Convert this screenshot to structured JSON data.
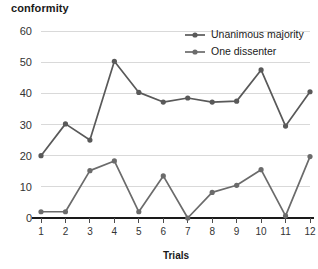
{
  "chart_data": {
    "type": "line",
    "title": "conformity",
    "xlabel": "Trials",
    "ylabel": "",
    "x": [
      1,
      2,
      3,
      4,
      5,
      6,
      7,
      8,
      9,
      10,
      11,
      12
    ],
    "xtick_labels": [
      "1",
      "2",
      "3",
      "4",
      "5",
      "6",
      "7",
      "8",
      "9",
      "10",
      "11",
      "12"
    ],
    "ytick_labels": [
      "0",
      "10",
      "20",
      "30",
      "40",
      "50",
      "60"
    ],
    "yticks": [
      0,
      10,
      20,
      30,
      40,
      50,
      60
    ],
    "ylim": [
      0,
      60
    ],
    "xlim": [
      1,
      12
    ],
    "grid": "horizontal",
    "legend_position": "top-right",
    "series": [
      {
        "name": "Unanimous majority",
        "color": "#595959",
        "marker": "circle",
        "values": [
          20.0,
          30.2,
          25.0,
          50.3,
          40.3,
          37.2,
          38.5,
          37.2,
          37.5,
          47.5,
          29.5,
          40.5
        ]
      },
      {
        "name": "One dissenter",
        "color": "#6b6b6b",
        "marker": "circle",
        "values": [
          2.0,
          2.0,
          15.2,
          18.3,
          2.0,
          13.5,
          0.0,
          8.2,
          10.5,
          15.5,
          0.7,
          19.7
        ]
      }
    ]
  },
  "legend": {
    "entries": [
      {
        "label": "Unanimous majority"
      },
      {
        "label": "One dissenter"
      }
    ]
  },
  "axes": {
    "x_title": "Trials",
    "y_title": ""
  },
  "colors": {
    "background": "#ffffff",
    "gridline": "#d9d9d9",
    "axis": "#1a1a1a",
    "text": "#1a1a1a",
    "series_majority": "#595959",
    "series_dissenter": "#6b6b6b"
  }
}
